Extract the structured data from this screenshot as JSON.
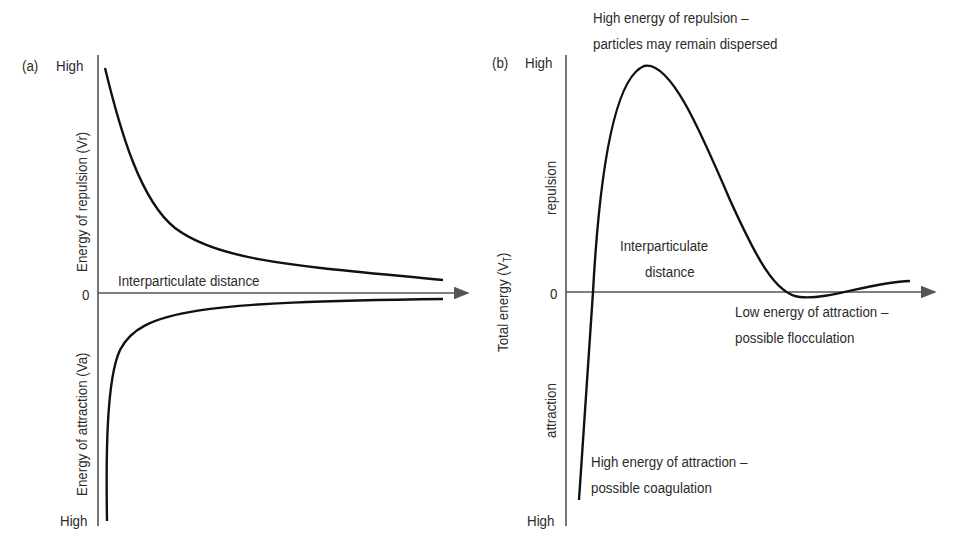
{
  "panel_a": {
    "tag": "(a)",
    "y_top": "High",
    "y_zero": "0",
    "y_bottom": "High",
    "y_label_upper": "Energy of repulsion (Vr)",
    "y_label_lower": "Energy of attraction (Va)",
    "x_label": "Interparticulate distance"
  },
  "panel_b": {
    "tag": "(b)",
    "y_top": "High",
    "y_zero": "0",
    "y_bottom": "High",
    "y_label": "Total energy (V",
    "y_label_sub": "T",
    "y_label_end": ")",
    "y_upper": "repulsion",
    "y_lower": "attraction",
    "x_label_line1": "Interparticulate",
    "x_label_line2": "distance",
    "annot_peak_line1": "High energy of repulsion –",
    "annot_peak_line2": "particles may remain dispersed",
    "annot_secondary_line1": "Low energy of attraction –",
    "annot_secondary_line2": "possible flocculation",
    "annot_primary_line1": "High energy of attraction –",
    "annot_primary_line2": "possible coagulation"
  },
  "colors": {
    "axis": "#555555",
    "curve": "#111111",
    "text": "#2b2b2b"
  }
}
